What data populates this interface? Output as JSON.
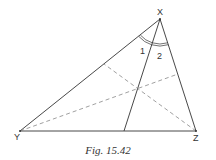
{
  "figure": {
    "caption": "Fig. 15.42",
    "vertices": {
      "X": {
        "label": "X",
        "x": 160,
        "y": 19
      },
      "Y": {
        "label": "Y",
        "x": 20,
        "y": 131
      },
      "Z": {
        "label": "Z",
        "x": 196,
        "y": 131
      }
    },
    "angle_labels": {
      "angle1": "1",
      "angle2": "2"
    },
    "solid_lines": [
      {
        "name": "side-XY",
        "from": [
          160,
          19
        ],
        "to": [
          20,
          131
        ]
      },
      {
        "name": "side-XZ",
        "from": [
          160,
          19
        ],
        "to": [
          196,
          131
        ]
      },
      {
        "name": "side-YZ",
        "from": [
          20,
          131
        ],
        "to": [
          196,
          131
        ]
      },
      {
        "name": "bisector-X",
        "from": [
          160,
          19
        ],
        "to": [
          124,
          131
        ]
      }
    ],
    "dashed_lines": [
      {
        "name": "dashed-from-Z",
        "from": [
          196,
          131
        ],
        "to": [
          104,
          64
        ]
      },
      {
        "name": "dashed-from-Y",
        "from": [
          20,
          131
        ],
        "to": [
          178,
          74
        ]
      }
    ],
    "colors": {
      "line": "#333333",
      "dashed": "#777777",
      "background": "#ffffff"
    }
  }
}
